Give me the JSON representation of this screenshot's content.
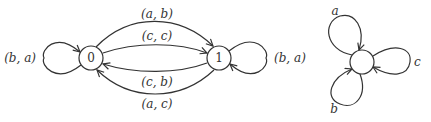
{
  "diagram": {
    "type": "state-transition-diagrams",
    "left_automaton": {
      "nodes": [
        {
          "id": "0",
          "label": "0"
        },
        {
          "id": "1",
          "label": "1"
        }
      ],
      "edges": [
        {
          "from": "0",
          "to": "0",
          "label": "(b, a)"
        },
        {
          "from": "0",
          "to": "1",
          "label": "(a, b)"
        },
        {
          "from": "0",
          "to": "1",
          "label": "(c, c)"
        },
        {
          "from": "1",
          "to": "0",
          "label": "(c, b)"
        },
        {
          "from": "1",
          "to": "0",
          "label": "(a, c)"
        },
        {
          "from": "1",
          "to": "1",
          "label": "(b, a)"
        }
      ]
    },
    "right_automaton": {
      "nodes": [
        {
          "id": "s",
          "label": ""
        }
      ],
      "edges": [
        {
          "from": "s",
          "to": "s",
          "label": "a"
        },
        {
          "from": "s",
          "to": "s",
          "label": "b"
        },
        {
          "from": "s",
          "to": "s",
          "label": "c"
        }
      ]
    }
  }
}
